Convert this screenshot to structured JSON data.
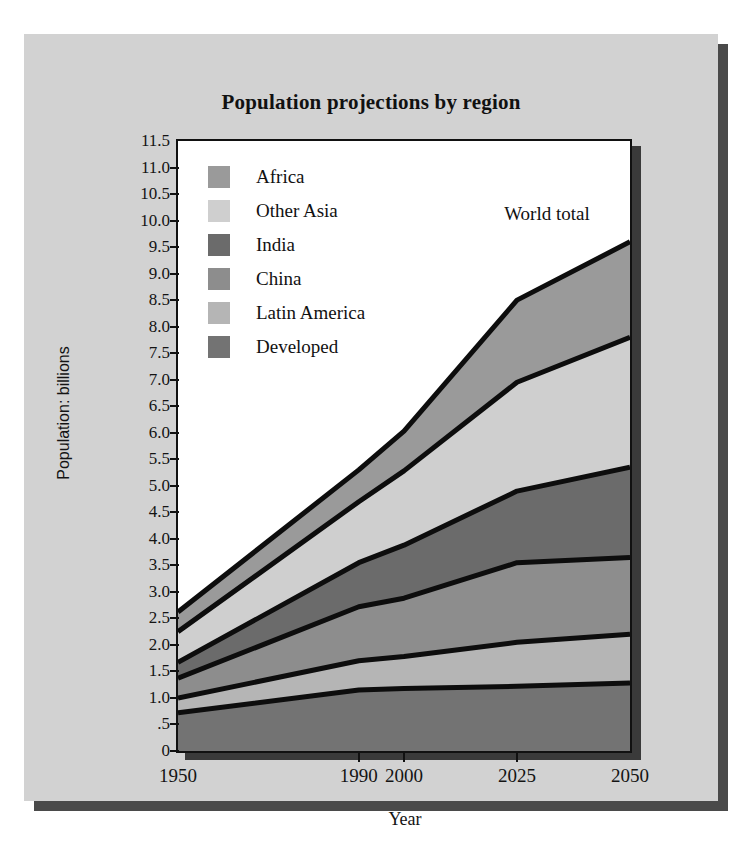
{
  "chart_data": {
    "type": "area",
    "title": "Population projections by region",
    "xlabel": "Year",
    "ylabel": "Population: billions",
    "categories": [
      "1950",
      "1990",
      "2000",
      "2025",
      "2050"
    ],
    "x": [
      1950,
      1990,
      2000,
      2025,
      2050
    ],
    "stacked": true,
    "grid": false,
    "legend_position": "inside-top-left",
    "ylim": [
      0,
      11.5
    ],
    "xlim": [
      1950,
      2050
    ],
    "ytick_labels": [
      "11.5",
      "11.0",
      "10.5",
      "10.0",
      "9.5",
      "9.0",
      "8.5",
      "8.0",
      "7.5",
      "7.0",
      "6.5",
      "6.0",
      "5.5",
      "5.0",
      "4.5",
      "4.0",
      "3.5",
      "3.0",
      "2.5",
      "2.0",
      "1.5",
      "1.0",
      ".5",
      "0"
    ],
    "ytick_values": [
      11.5,
      11.0,
      10.5,
      10.0,
      9.5,
      9.0,
      8.5,
      8.0,
      7.5,
      7.0,
      6.5,
      6.0,
      5.5,
      5.0,
      4.5,
      4.0,
      3.5,
      3.0,
      2.5,
      2.0,
      1.5,
      1.0,
      0.5,
      0
    ],
    "xtick_labels": [
      "1950",
      "1990",
      "2000",
      "2025",
      "2050"
    ],
    "annotations": [
      {
        "text": "World total",
        "x": 2035,
        "y": 10.1
      }
    ],
    "series": [
      {
        "name": "Developed",
        "color": "#737373",
        "values": [
          0.72,
          1.15,
          1.18,
          1.22,
          1.28
        ]
      },
      {
        "name": "Latin America",
        "color": "#b5b5b5",
        "values": [
          0.28,
          0.55,
          0.6,
          0.83,
          0.92
        ]
      },
      {
        "name": "China",
        "color": "#8d8d8d",
        "values": [
          0.37,
          1.02,
          1.1,
          1.5,
          1.45
        ]
      },
      {
        "name": "India",
        "color": "#6b6b6b",
        "values": [
          0.3,
          0.83,
          1.0,
          1.35,
          1.7
        ]
      },
      {
        "name": "Other Asia",
        "color": "#cfcfcf",
        "values": [
          0.58,
          1.15,
          1.4,
          2.05,
          2.45
        ]
      },
      {
        "name": "Africa",
        "color": "#9a9a9a",
        "values": [
          0.37,
          0.6,
          0.75,
          1.55,
          1.8
        ]
      }
    ],
    "cumulative_tops": {
      "Developed": [
        0.72,
        1.15,
        1.18,
        1.22,
        1.28
      ],
      "Latin America": [
        1.0,
        1.7,
        1.78,
        2.05,
        2.2
      ],
      "China": [
        1.37,
        2.72,
        2.88,
        3.55,
        3.65
      ],
      "India": [
        1.67,
        3.55,
        3.88,
        4.9,
        5.35
      ],
      "Other Asia": [
        2.25,
        4.7,
        5.28,
        6.95,
        7.8
      ],
      "Africa": [
        2.62,
        5.3,
        6.03,
        8.5,
        9.6
      ]
    },
    "world_total": [
      2.62,
      5.3,
      6.03,
      8.5,
      9.6
    ]
  },
  "legend": {
    "items": [
      {
        "label": "Africa",
        "color": "#9a9a9a"
      },
      {
        "label": "Other Asia",
        "color": "#cfcfcf"
      },
      {
        "label": "India",
        "color": "#6b6b6b"
      },
      {
        "label": "China",
        "color": "#8d8d8d"
      },
      {
        "label": "Latin America",
        "color": "#b5b5b5"
      },
      {
        "label": "Developed",
        "color": "#737373"
      }
    ]
  },
  "colors": {
    "page_background": "#ffffff",
    "card_background": "#d2d2d2",
    "plot_background": "#ffffff",
    "axis": "#111111",
    "shadow": "#4a4a4a"
  }
}
